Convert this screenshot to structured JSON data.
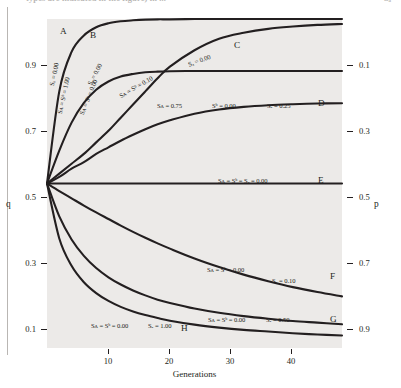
{
  "page": {
    "caption_left": "types are indicated in the figure) in ...",
    "caption_right": "Sₐ",
    "gutter_rule": "page-edge-rule"
  },
  "figure": {
    "plot_background": "#eceae8",
    "curve_color": "#231f20",
    "axis_color": "#231f20"
  },
  "chart_data": {
    "type": "line",
    "title": "",
    "subtitle": "",
    "xlabel": "Generations",
    "ylabel": "q",
    "ylabel_right": "p",
    "xlim": [
      0,
      48
    ],
    "ylim": [
      0,
      1
    ],
    "grid": false,
    "legend": "inline-annotations",
    "xticks": [
      10,
      20,
      30,
      40
    ],
    "xticklabels": [
      "10",
      "20",
      "30",
      "40"
    ],
    "yticks_left": [
      0.9,
      0.7,
      0.5,
      0.3,
      0.1
    ],
    "yticklabels_left": [
      "0.9",
      "0.7",
      "0.5",
      "0.3",
      "0.1"
    ],
    "yticks_right": [
      0.9,
      0.7,
      0.5,
      0.3,
      0.1
    ],
    "yticklabels_right": [
      "0.1",
      "0.3",
      "0.5",
      "0.7",
      "0.9"
    ],
    "x": [
      0,
      2,
      4,
      6,
      8,
      10,
      12,
      14,
      16,
      18,
      20,
      24,
      28,
      32,
      36,
      40,
      44,
      48
    ],
    "series": [
      {
        "name": "A",
        "label": "A",
        "params": "Sᴀ = Sᵇ = 1.00   Sₐ = 0.00",
        "annotation_1": "Sᴀ = Sᵇ = 1.00",
        "annotation_2": "Sₐ = 0.00",
        "values": [
          0.5,
          0.78,
          0.9,
          0.95,
          0.975,
          0.987,
          0.993,
          0.996,
          0.998,
          0.999,
          0.999,
          1.0,
          1.0,
          1.0,
          1.0,
          1.0,
          1.0,
          1.0
        ]
      },
      {
        "name": "B",
        "label": "B",
        "params": "Sᴀ = Sᵇ = 0.00   Sₐ = 0.00",
        "annotation_1": "Sᴀ = Sᵇ = 0.00",
        "annotation_2": "Sₐ = 0.00",
        "values": [
          0.5,
          0.6,
          0.685,
          0.745,
          0.785,
          0.81,
          0.825,
          0.833,
          0.838,
          0.84,
          0.841,
          0.842,
          0.842,
          0.842,
          0.842,
          0.842,
          0.842,
          0.842
        ]
      },
      {
        "name": "C",
        "label": "C",
        "params": "Sᴀ = Sᵇ = 0.10   Sₐ = 0.00",
        "annotation_1": "Sᴀ = Sᵇ = 0.10",
        "annotation_2": "Sₐ = 0.00",
        "values": [
          0.5,
          0.53,
          0.56,
          0.59,
          0.625,
          0.66,
          0.7,
          0.74,
          0.78,
          0.82,
          0.855,
          0.905,
          0.94,
          0.958,
          0.97,
          0.977,
          0.982,
          0.985
        ]
      },
      {
        "name": "D",
        "label": "D",
        "params": "Sᴀ = 0.75   Sᵇ = 0.00   Sₐ = 0.25",
        "annotation_1": "Sᴀ = 0.75",
        "annotation_2": "Sᵇ = 0.00",
        "annotation_3": "Sₐ = 0.25",
        "values": [
          0.5,
          0.52,
          0.545,
          0.565,
          0.59,
          0.61,
          0.63,
          0.648,
          0.665,
          0.68,
          0.692,
          0.712,
          0.725,
          0.733,
          0.738,
          0.741,
          0.743,
          0.744
        ]
      },
      {
        "name": "E",
        "label": "E",
        "params": "Sᴀ = Sᵇ = Sₐ = 0.00",
        "annotation_1": "Sᴀ = Sᵇ = Sₐ = 0.00",
        "values": [
          0.5,
          0.5,
          0.5,
          0.5,
          0.5,
          0.5,
          0.5,
          0.5,
          0.5,
          0.5,
          0.5,
          0.5,
          0.5,
          0.5,
          0.5,
          0.5,
          0.5,
          0.5
        ]
      },
      {
        "name": "F",
        "label": "F",
        "params": "Sᴀ = Sᵇ = 0.00   Sₐ = 0.10",
        "annotation_1": "Sᴀ = Sᵇ = 0.00",
        "annotation_2": "Sₐ = 0.10",
        "values": [
          0.5,
          0.477,
          0.455,
          0.433,
          0.412,
          0.392,
          0.372,
          0.353,
          0.335,
          0.318,
          0.302,
          0.272,
          0.246,
          0.223,
          0.203,
          0.185,
          0.17,
          0.157
        ]
      },
      {
        "name": "G",
        "label": "G",
        "params": "Sᴀ = Sᵇ = 0.00   Sₐ = 0.50",
        "annotation_1": "Sᴀ = Sᵇ = 0.00",
        "annotation_2": "Sₐ = 0.50",
        "values": [
          0.5,
          0.4,
          0.33,
          0.28,
          0.243,
          0.215,
          0.193,
          0.175,
          0.16,
          0.147,
          0.137,
          0.12,
          0.107,
          0.097,
          0.089,
          0.082,
          0.077,
          0.072
        ]
      },
      {
        "name": "H",
        "label": "H",
        "params": "Sᴀ = Sᵇ = 0.00   Sₐ = 1.00",
        "annotation_1": "Sᴀ = Sᵇ = 0.00",
        "annotation_2": "Sₐ = 1.00",
        "values": [
          0.5,
          0.333,
          0.25,
          0.2,
          0.167,
          0.143,
          0.125,
          0.111,
          0.1,
          0.091,
          0.083,
          0.071,
          0.062,
          0.055,
          0.05,
          0.045,
          0.041,
          0.038
        ]
      }
    ]
  }
}
